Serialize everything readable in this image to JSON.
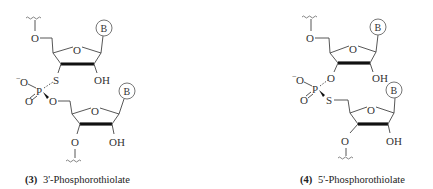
{
  "figure": {
    "structures": [
      {
        "id": "left",
        "number": "(3)",
        "name": "3'-Phosphorothiolate",
        "atoms": {
          "top_o": "O",
          "ring_o1": "O",
          "base1": "B",
          "bridge_s": "S",
          "oh1": "OH",
          "o_minus": "O",
          "minus": "−",
          "p": "P",
          "o_double": "O",
          "o_ester": "O",
          "ring_o2": "O",
          "base2": "B",
          "bottom_o": "O",
          "oh2": "OH"
        }
      },
      {
        "id": "right",
        "number": "(4)",
        "name": "5'-Phosphorothiolate",
        "atoms": {
          "top_o": "O",
          "ring_o1": "O",
          "base1": "B",
          "o3": "O",
          "oh1": "OH",
          "o_minus": "O",
          "minus": "−",
          "p": "P",
          "o_double": "O",
          "bridge_s": "S",
          "ring_o2": "O",
          "base2": "B",
          "bottom_o": "O",
          "oh2": "OH"
        }
      }
    ]
  }
}
